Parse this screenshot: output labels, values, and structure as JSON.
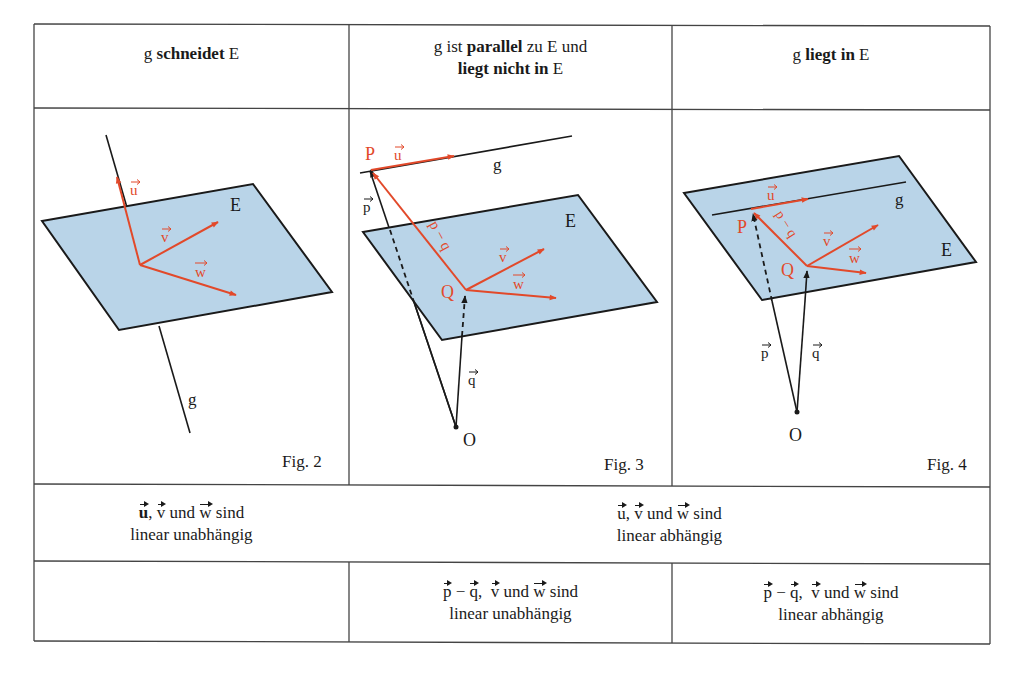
{
  "header": {
    "col1": {
      "pre": "g ",
      "bold": "schneidet",
      "post": " E"
    },
    "col2": {
      "line1_pre": "g ist ",
      "line1_bold": "parallel",
      "line1_post": " zu E und",
      "line2_bold": "liegt nicht in",
      "line2_post": " E"
    },
    "col3": {
      "pre": "g ",
      "bold": "liegt in",
      "post": " E"
    }
  },
  "figures": {
    "fig2": {
      "caption": "Fig. 2",
      "labels": {
        "plane": "E",
        "line": "g",
        "u": "u",
        "v": "v",
        "w": "w"
      }
    },
    "fig3": {
      "caption": "Fig. 3",
      "labels": {
        "plane": "E",
        "line": "g",
        "P": "P",
        "Q": "Q",
        "O": "O",
        "u": "u",
        "v": "v",
        "w": "w",
        "p": "p",
        "q": "q",
        "pq": "p − q"
      }
    },
    "fig4": {
      "caption": "Fig. 4",
      "labels": {
        "plane": "E",
        "line": "g",
        "P": "P",
        "Q": "Q",
        "O": "O",
        "u": "u",
        "v": "v",
        "w": "w",
        "p": "p",
        "q": "q",
        "pq": "p − q"
      }
    }
  },
  "row3": {
    "col1": {
      "u": "u",
      "sep": ", ",
      "v": "v",
      "und": " und ",
      "w": "w",
      "sind": " sind",
      "line2": "linear unabhängig"
    },
    "col23": {
      "u": "u",
      "sep": ", ",
      "v": "v",
      "und": " und ",
      "w": "w",
      "sind": " sind",
      "line2": "linear abhängig"
    }
  },
  "row4": {
    "col1": "",
    "col2": {
      "p": "p",
      "minus": " − ",
      "q": "q",
      "sep": ",  ",
      "v": "v",
      "und": " und ",
      "w": "w",
      "sind": " sind",
      "line2": "linear unabhängig"
    },
    "col3": {
      "p": "p",
      "minus": " − ",
      "q": "q",
      "sep": ",  ",
      "v": "v",
      "und": " und ",
      "w": "w",
      "sind": " sind",
      "line2": "linear abhängig"
    }
  },
  "colors": {
    "plane": "#b9d4e8",
    "vector": "#e2492a",
    "line": "#1a1a1a",
    "border": "#444444"
  }
}
